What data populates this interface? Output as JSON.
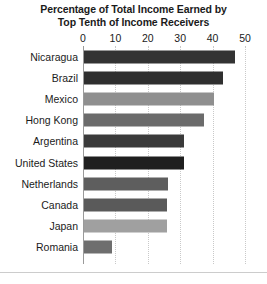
{
  "chart_data": {
    "type": "bar",
    "orientation": "horizontal",
    "title": "Percentage of Total Income Earned by Top Tenth of Income Receivers",
    "title_lines": [
      "Percentage of Total Income Earned by",
      "Top Tenth of Income Receivers"
    ],
    "xlabel": "",
    "ylabel": "",
    "xlim": [
      0,
      50
    ],
    "xticks": [
      0,
      10,
      20,
      30,
      40,
      50
    ],
    "xtick_labels": [
      "0",
      "10",
      "20",
      "30",
      "40",
      "50"
    ],
    "grid": true,
    "grid_style": "dotted vertical",
    "legend": "none",
    "categories": [
      "Nicaragua",
      "Brazil",
      "Mexico",
      "Hong Kong",
      "Argentina",
      "United States",
      "Netherlands",
      "Canada",
      "Japan",
      "Romania"
    ],
    "values": [
      46.5,
      43,
      40,
      37,
      31,
      31,
      26,
      25.5,
      25.5,
      8.5
    ],
    "bar_colors": [
      "#333333",
      "#2f2f2f",
      "#8f8f8f",
      "#6b6b6b",
      "#3a3a3a",
      "#1f1f1f",
      "#5e5e5e",
      "#5a5a5a",
      "#a0a0a0",
      "#6e6e6e"
    ],
    "bars": [
      {
        "category": "Nicaragua",
        "value": 46.5,
        "color": "#333333"
      },
      {
        "category": "Brazil",
        "value": 43,
        "color": "#2f2f2f"
      },
      {
        "category": "Mexico",
        "value": 40,
        "color": "#8f8f8f"
      },
      {
        "category": "Hong Kong",
        "value": 37,
        "color": "#6b6b6b"
      },
      {
        "category": "Argentina",
        "value": 31,
        "color": "#3a3a3a"
      },
      {
        "category": "United States",
        "value": 31,
        "color": "#1f1f1f"
      },
      {
        "category": "Netherlands",
        "value": 26,
        "color": "#5e5e5e"
      },
      {
        "category": "Canada",
        "value": 25.5,
        "color": "#5a5a5a"
      },
      {
        "category": "Japan",
        "value": 25.5,
        "color": "#a0a0a0"
      },
      {
        "category": "Romania",
        "value": 8.5,
        "color": "#6e6e6e"
      }
    ]
  }
}
